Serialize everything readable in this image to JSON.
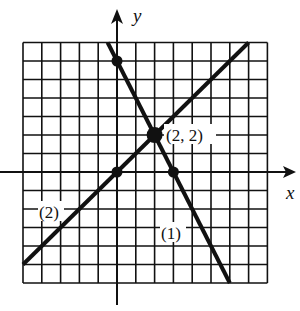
{
  "chart_data": {
    "type": "line",
    "title": "",
    "xlabel": "x",
    "ylabel": "y",
    "xlim": [
      -5,
      8
    ],
    "ylim": [
      -6,
      7
    ],
    "grid": true,
    "series": [
      {
        "name": "(1)",
        "equation": "y = -2x + 6",
        "points": [
          [
            -0.5,
            7
          ],
          [
            0,
            6
          ],
          [
            2,
            2
          ],
          [
            3,
            0
          ],
          [
            6,
            -6
          ]
        ]
      },
      {
        "name": "(2)",
        "equation": "y = x",
        "points": [
          [
            -5,
            -5
          ],
          [
            0,
            0
          ],
          [
            2,
            2
          ],
          [
            7,
            7
          ]
        ]
      }
    ],
    "marked_points": [
      {
        "x": 0,
        "y": 6
      },
      {
        "x": 0,
        "y": 0
      },
      {
        "x": 3,
        "y": 0
      },
      {
        "x": 2,
        "y": 2,
        "label": "(2, 2)",
        "emphasized": true
      }
    ]
  },
  "labels": {
    "x_axis": "x",
    "y_axis": "y",
    "intersection": "(2, 2)",
    "line1": "(1)",
    "line2": "(2)"
  },
  "colors": {
    "ink": "#111111",
    "background": "#ffffff"
  }
}
